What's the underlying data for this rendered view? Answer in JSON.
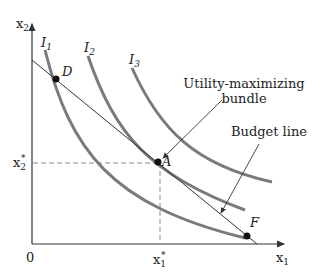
{
  "axes": {
    "y_label": "x",
    "y_label_sub": "2",
    "x_label": "x",
    "x_label_sub": "1",
    "origin_label": "0"
  },
  "curves": [
    {
      "name": "I",
      "sub": "1"
    },
    {
      "name": "I",
      "sub": "2"
    },
    {
      "name": "I",
      "sub": "3"
    }
  ],
  "points": {
    "D": "D",
    "A": "A",
    "F": "F"
  },
  "ticks": {
    "x2_star": "x",
    "x2_star_sub": "2",
    "x1_star": "x",
    "x1_star_sub": "1",
    "star": "*"
  },
  "annotations": {
    "utility_line1": "Utility-maximizing",
    "utility_line2": "bundle",
    "budget": "Budget line"
  },
  "colors": {
    "curve": "#7a7a7a",
    "line": "#333333",
    "dashed": "#888888"
  }
}
